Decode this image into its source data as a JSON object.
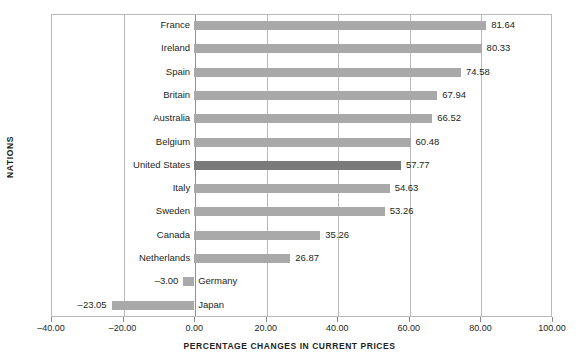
{
  "chart_data": {
    "type": "bar",
    "orientation": "horizontal",
    "title": "",
    "xlabel": "PERCENTAGE CHANGES IN CURRENT PRICES",
    "ylabel": "NATIONS",
    "xlim": [
      -40.0,
      100.0
    ],
    "xticks": [
      "-40.00",
      "-20.00",
      "0.00",
      "20.00",
      "40.00",
      "60.00",
      "80.00",
      "100.00"
    ],
    "xtick_values": [
      -40,
      -20,
      0,
      20,
      40,
      60,
      80,
      100
    ],
    "grid": true,
    "legend": "none",
    "categories": [
      "France",
      "Ireland",
      "Spain",
      "Britain",
      "Australia",
      "Belgium",
      "United States",
      "Italy",
      "Sweden",
      "Canada",
      "Netherlands",
      "Germany",
      "Japan"
    ],
    "values": [
      81.64,
      80.33,
      74.58,
      67.94,
      66.52,
      60.48,
      57.77,
      54.63,
      53.26,
      35.26,
      26.87,
      -3.0,
      -23.05
    ],
    "value_labels": [
      "81.64",
      "80.33",
      "74.58",
      "67.94",
      "66.52",
      "60.48",
      "57.77",
      "54.63",
      "53.26",
      "35.26",
      "26.87",
      "-3.00",
      "-23.05"
    ],
    "highlighted_category": "United States",
    "colors": {
      "bar": "#a9a9a9",
      "bar_highlight": "#7b7b7b",
      "axis": "#b9b9b9",
      "zero_axis": "#8f8f8f",
      "text": "#231f20"
    }
  }
}
